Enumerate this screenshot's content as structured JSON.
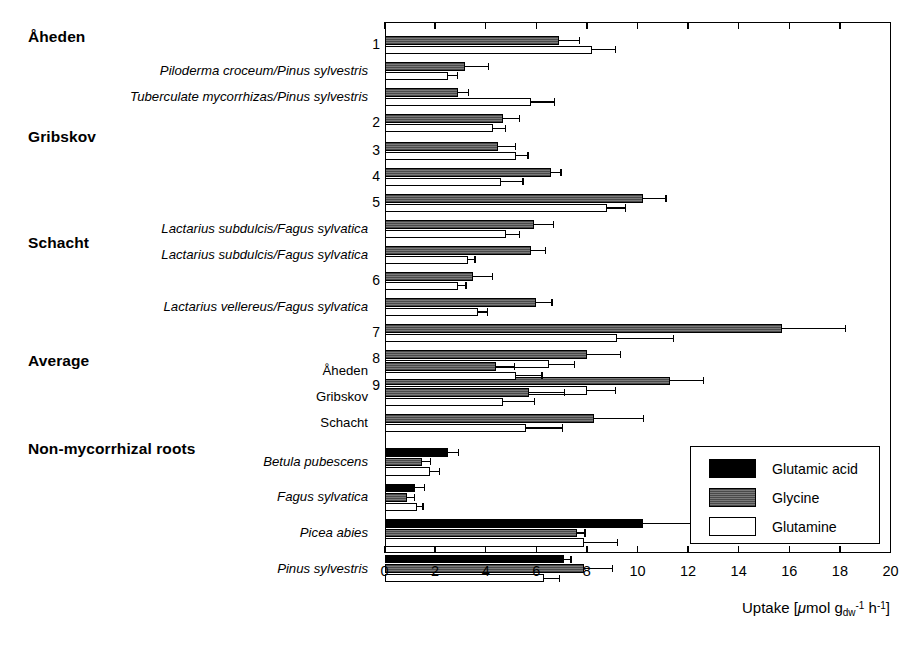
{
  "chart_data": {
    "type": "bar",
    "orientation": "horizontal",
    "title": "",
    "xlabel": "Uptake [µmol g_dw^-1 h^-1]",
    "xlabel_parts": {
      "prefix": "Uptake [",
      "mu": "μ",
      "mol": "mol g",
      "sub1": "dw",
      "sup1": "-1",
      "mid": " h",
      "sup2": "-1",
      "suffix": "]"
    },
    "ylabel": "",
    "xlim": [
      0,
      20
    ],
    "xticks": [
      0,
      2,
      4,
      6,
      8,
      10,
      12,
      14,
      16,
      18,
      20
    ],
    "grid": false,
    "legend_position": "bottom-right",
    "series": [
      {
        "name": "Glutamic acid",
        "key": "glu",
        "color": "#000000",
        "fill": "solid-black"
      },
      {
        "name": "Glycine",
        "key": "gly",
        "color": "#555555",
        "fill": "dark-gray-hatched"
      },
      {
        "name": "Glutamine",
        "key": "gln",
        "color": "#ffffff",
        "fill": "white"
      }
    ],
    "groups": [
      {
        "title": "Åheden",
        "rows": [
          {
            "ytick": "1",
            "label": "",
            "bars": [
              {
                "series": "gly",
                "value": 6.9,
                "error": 0.8
              },
              {
                "series": "gln",
                "value": 8.2,
                "error": 0.9
              }
            ]
          },
          {
            "ytick": "",
            "label": "Piloderma croceum/Pinus sylvestris",
            "bars": [
              {
                "series": "gly",
                "value": 3.2,
                "error": 0.9
              },
              {
                "series": "gln",
                "value": 2.5,
                "error": 0.35
              }
            ]
          },
          {
            "ytick": "",
            "label": "Tuberculate mycorrhizas/Pinus sylvestris",
            "bars": [
              {
                "series": "gly",
                "value": 2.9,
                "error": 0.4
              },
              {
                "series": "gln",
                "value": 5.8,
                "error": 0.9
              }
            ]
          },
          {
            "ytick": "2",
            "label": "",
            "bars": [
              {
                "series": "gly",
                "value": 4.7,
                "error": 0.6
              },
              {
                "series": "gln",
                "value": 4.3,
                "error": 0.45
              }
            ]
          }
        ]
      },
      {
        "title": "Gribskov",
        "rows": [
          {
            "ytick": "3",
            "label": "",
            "bars": [
              {
                "series": "gly",
                "value": 4.5,
                "error": 0.65
              },
              {
                "series": "gln",
                "value": 5.2,
                "error": 0.45
              }
            ]
          },
          {
            "ytick": "4",
            "label": "",
            "bars": [
              {
                "series": "gly",
                "value": 6.6,
                "error": 0.35
              },
              {
                "series": "gln",
                "value": 4.6,
                "error": 0.85
              }
            ]
          },
          {
            "ytick": "5",
            "label": "",
            "bars": [
              {
                "series": "gly",
                "value": 10.2,
                "error": 0.9
              },
              {
                "series": "gln",
                "value": 8.8,
                "error": 0.7
              }
            ]
          },
          {
            "ytick": "",
            "label": "Lactarius subdulcis/Fagus sylvatica",
            "bars": [
              {
                "series": "gly",
                "value": 5.9,
                "error": 0.75
              },
              {
                "series": "gln",
                "value": 4.8,
                "error": 0.5
              }
            ]
          }
        ]
      },
      {
        "title": "Schacht",
        "rows": [
          {
            "ytick": "",
            "label": "Lactarius subdulcis/Fagus sylvatica",
            "bars": [
              {
                "series": "gly",
                "value": 5.8,
                "error": 0.55
              },
              {
                "series": "gln",
                "value": 3.3,
                "error": 0.25
              }
            ]
          },
          {
            "ytick": "6",
            "label": "",
            "bars": [
              {
                "series": "gly",
                "value": 3.5,
                "error": 0.75
              },
              {
                "series": "gln",
                "value": 2.9,
                "error": 0.3
              }
            ]
          },
          {
            "ytick": "",
            "label": "Lactarius vellereus/Fagus sylvatica",
            "bars": [
              {
                "series": "gly",
                "value": 6.0,
                "error": 0.6
              },
              {
                "series": "gln",
                "value": 3.7,
                "error": 0.35
              }
            ]
          },
          {
            "ytick": "7",
            "label": "",
            "bars": [
              {
                "series": "gly",
                "value": 15.7,
                "error": 2.5
              },
              {
                "series": "gln",
                "value": 9.2,
                "error": 2.2
              }
            ]
          },
          {
            "ytick": "8",
            "label": "",
            "bars": [
              {
                "series": "gly",
                "value": 8.0,
                "error": 1.3
              },
              {
                "series": "gln",
                "value": 6.5,
                "error": 1.0
              }
            ]
          },
          {
            "ytick": "9",
            "label": "",
            "bars": [
              {
                "series": "gly",
                "value": 11.3,
                "error": 1.3
              },
              {
                "series": "gln",
                "value": 8.0,
                "error": 1.1
              }
            ]
          }
        ]
      },
      {
        "title": "Average",
        "rows": [
          {
            "ytick": "",
            "label": "Åheden",
            "bars": [
              {
                "series": "gly",
                "value": 4.4,
                "error": 0.7
              },
              {
                "series": "gln",
                "value": 5.2,
                "error": 1.0
              }
            ]
          },
          {
            "ytick": "",
            "label": "Gribskov",
            "bars": [
              {
                "series": "gly",
                "value": 5.7,
                "error": 1.4
              },
              {
                "series": "gln",
                "value": 4.7,
                "error": 1.2
              }
            ]
          },
          {
            "ytick": "",
            "label": "Schacht",
            "bars": [
              {
                "series": "gly",
                "value": 8.3,
                "error": 1.9
              },
              {
                "series": "gln",
                "value": 5.6,
                "error": 1.4
              }
            ]
          }
        ]
      },
      {
        "title": "Non-mycorrhizal roots",
        "rows": [
          {
            "ytick": "",
            "label": "Betula pubescens",
            "bars": [
              {
                "series": "glu",
                "value": 2.5,
                "error": 0.4
              },
              {
                "series": "gly",
                "value": 1.5,
                "error": 0.3
              },
              {
                "series": "gln",
                "value": 1.8,
                "error": 0.35
              }
            ]
          },
          {
            "ytick": "",
            "label": "Fagus sylvatica",
            "bars": [
              {
                "series": "glu",
                "value": 1.2,
                "error": 0.35
              },
              {
                "series": "gly",
                "value": 0.9,
                "error": 0.25
              },
              {
                "series": "gln",
                "value": 1.3,
                "error": 0.2
              }
            ]
          },
          {
            "ytick": "",
            "label": "Picea abies",
            "bars": [
              {
                "series": "glu",
                "value": 10.2,
                "error": 2.8
              },
              {
                "series": "gly",
                "value": 7.6,
                "error": 0.3
              },
              {
                "series": "gln",
                "value": 7.9,
                "error": 1.3
              }
            ]
          },
          {
            "ytick": "",
            "label": "Pinus sylvestris",
            "bars": [
              {
                "series": "glu",
                "value": 7.1,
                "error": 0.25
              },
              {
                "series": "gly",
                "value": 7.9,
                "error": 1.1
              },
              {
                "series": "gln",
                "value": 6.3,
                "error": 0.6
              }
            ]
          }
        ]
      }
    ]
  },
  "legend": {
    "items": [
      {
        "label": "Glutamic acid",
        "key": "glu"
      },
      {
        "label": "Glycine",
        "key": "gly"
      },
      {
        "label": "Glutamine",
        "key": "gln"
      }
    ]
  }
}
